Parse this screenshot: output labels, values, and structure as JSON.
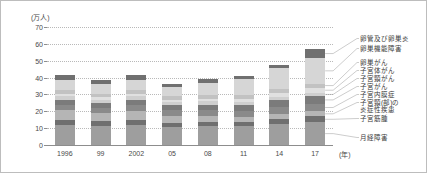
{
  "chart_data": {
    "type": "bar",
    "stacked": true,
    "title": "",
    "unit_label": "(万人)",
    "xlabel": "(年)",
    "ylabel": "",
    "ylim": [
      0,
      70
    ],
    "yticks": [
      0,
      10,
      20,
      30,
      40,
      50,
      60,
      70
    ],
    "grid": true,
    "legend_position": "right",
    "categories": [
      "1996",
      "99",
      "2002",
      "05",
      "08",
      "11",
      "14",
      "17"
    ],
    "series": [
      {
        "name": "月経障害",
        "color": "#9e9e9e",
        "values": [
          12.0,
          11.5,
          12.0,
          10.5,
          11.0,
          11.0,
          12.5,
          13.5
        ]
      },
      {
        "name": "子宮筋腫",
        "color": "#6f6f6f",
        "values": [
          3.0,
          2.5,
          3.0,
          2.5,
          2.5,
          2.5,
          3.0,
          3.5
        ]
      },
      {
        "name": "子宮頸(部)の炎症性疾患",
        "color": "#b5b5b5",
        "values": [
          5.5,
          5.0,
          5.0,
          4.0,
          3.5,
          3.0,
          3.0,
          3.0
        ]
      },
      {
        "name": "子宮内膜症",
        "color": "#8a8a8a",
        "values": [
          3.0,
          3.0,
          3.5,
          3.5,
          3.5,
          3.5,
          4.0,
          4.5
        ]
      },
      {
        "name": "子宮がん",
        "color": "#7b7b7b",
        "values": [
          3.5,
          3.0,
          3.5,
          3.0,
          3.5,
          3.5,
          4.0,
          4.5
        ]
      },
      {
        "name": "子宮頸がん",
        "color": "#cfcfcf",
        "values": [
          2.0,
          2.0,
          2.0,
          2.0,
          2.0,
          2.0,
          2.0,
          2.0
        ]
      },
      {
        "name": "子宮体がん",
        "color": "#e0e0e0",
        "values": [
          1.5,
          1.5,
          1.5,
          1.5,
          1.5,
          2.0,
          2.5,
          3.0
        ]
      },
      {
        "name": "卵巣がん",
        "color": "#c2c2c2",
        "values": [
          2.0,
          2.0,
          2.0,
          2.0,
          2.0,
          2.0,
          2.5,
          2.5
        ]
      },
      {
        "name": "卵巣機能障害",
        "color": "#d6d6d6",
        "values": [
          6.0,
          5.5,
          6.0,
          5.5,
          7.5,
          9.5,
          12.0,
          15.0
        ]
      },
      {
        "name": "卵管及び卵巣炎",
        "color": "#707070",
        "values": [
          3.0,
          2.5,
          3.0,
          2.0,
          2.0,
          2.0,
          2.0,
          5.5
        ]
      }
    ],
    "totals": [
      41.5,
      38.5,
      41.5,
      36.5,
      39.0,
      41.0,
      47.5,
      57.0
    ]
  },
  "legend": {
    "items": [
      "卵管及び卵巣炎",
      "卵巣機能障害",
      "卵巣がん",
      "子宮体がん",
      "子宮頸がん",
      "子宮がん",
      "子宮内膜症",
      "子宮頸(部)の",
      "炎症性疾患",
      "子宮筋腫",
      "月経障害"
    ]
  }
}
